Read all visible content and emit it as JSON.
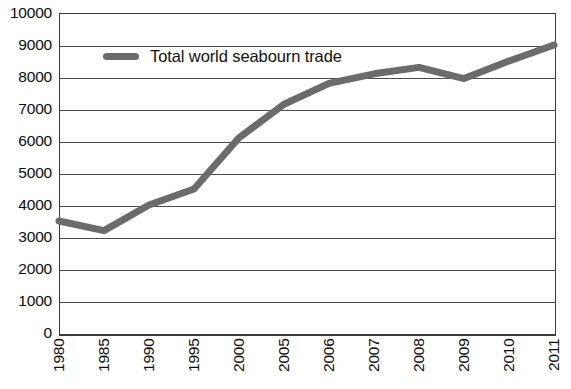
{
  "chart_data": {
    "type": "line",
    "title": "",
    "subtitle": "",
    "xlabel": "",
    "ylabel": "",
    "categories": [
      "1980",
      "1985",
      "1990",
      "1995",
      "2000",
      "2005",
      "2006",
      "2007",
      "2008",
      "2009",
      "2010",
      "2011"
    ],
    "series": [
      {
        "name": "Total world seabourn trade",
        "color": "#6b6b6b",
        "values": [
          3500,
          3200,
          4000,
          4500,
          6100,
          7150,
          7800,
          8100,
          8300,
          7950,
          8500,
          9000
        ]
      }
    ],
    "ylim": [
      0,
      10000
    ],
    "ytick_step": 1000,
    "yticks": [
      "10000",
      "9000",
      "8000",
      "7000",
      "6000",
      "5000",
      "4000",
      "3000",
      "2000",
      "1000",
      "0"
    ],
    "grid": "horizontal",
    "legend_position": "top-left-inside",
    "axis_color": "#3a3a3a",
    "grid_color": "#4a4a4a",
    "background": "#ffffff"
  },
  "legend": {
    "label": "Total world seabourn trade",
    "swatch_name": "line-swatch"
  }
}
